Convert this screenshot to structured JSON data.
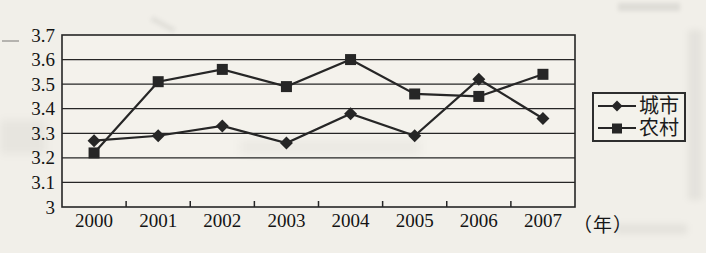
{
  "figure": {
    "kind": "scanned-line-chart",
    "background": "#f1efe9",
    "ink_color": "#262626"
  },
  "chart_data": {
    "type": "line",
    "title": "",
    "categories": [
      "2000",
      "2001",
      "2002",
      "2003",
      "2004",
      "2005",
      "2006",
      "2007"
    ],
    "series": [
      {
        "name": "城市",
        "marker": "diamond",
        "color": "#262626",
        "values": [
          3.27,
          3.29,
          3.33,
          3.26,
          3.38,
          3.29,
          3.52,
          3.36
        ]
      },
      {
        "name": "农村",
        "marker": "square",
        "color": "#262626",
        "values": [
          3.22,
          3.51,
          3.56,
          3.49,
          3.6,
          3.46,
          3.45,
          3.54
        ]
      }
    ],
    "xlabel": "",
    "xlabel_unit": "（年）",
    "ylabel": "",
    "ylim": [
      3.0,
      3.7
    ],
    "ytick_step": 0.1,
    "ytick_labels": [
      "3",
      "3.1",
      "3.2",
      "3.3",
      "3.4",
      "3.5",
      "3.6",
      "3.7"
    ],
    "grid": "horizontal",
    "legend_position": "right",
    "legend_border": true
  }
}
